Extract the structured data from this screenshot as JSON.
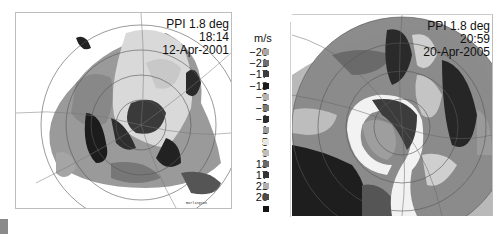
{
  "left_panel": {
    "title_line1": "PPI 1.8 deg",
    "title_line2": "18:14",
    "title_line3": "12-Apr-2001",
    "map_labels": [
      "Burlington"
    ]
  },
  "right_panel": {
    "title_line1": "PPI 1.8 deg",
    "title_line2": "20:59",
    "title_line3": "20-Apr-2005"
  },
  "legend": {
    "unit": "m/s",
    "entries": [
      {
        "value": "−26",
        "color": "#a8a8a8"
      },
      {
        "value": "−21",
        "color": "#6e6e6e"
      },
      {
        "value": "−17",
        "color": "#3c3c3c"
      },
      {
        "value": "−13",
        "color": "#1a1a1a"
      },
      {
        "value": "−9",
        "color": "#b4b4b4"
      },
      {
        "value": "−5",
        "color": "#7a7a7a"
      },
      {
        "value": "−1",
        "color": "#2a2a2a"
      },
      {
        "value": "1",
        "color": "#9e9e9e"
      },
      {
        "value": "5",
        "color": "#e6e6e6"
      },
      {
        "value": "9",
        "color": "#bebebe"
      },
      {
        "value": "13",
        "color": "#6a6a6a"
      },
      {
        "value": "17",
        "color": "#333333"
      },
      {
        "value": "21",
        "color": "#b0b0b0"
      },
      {
        "value": "26",
        "color": "#4a4a4a"
      },
      {
        "value": "",
        "color": "#141414"
      }
    ]
  },
  "caption": {
    "text": "Left: Doppler PPI 18:14 12-Apr-2001 · Right: 20:59 20-Apr-2005"
  }
}
